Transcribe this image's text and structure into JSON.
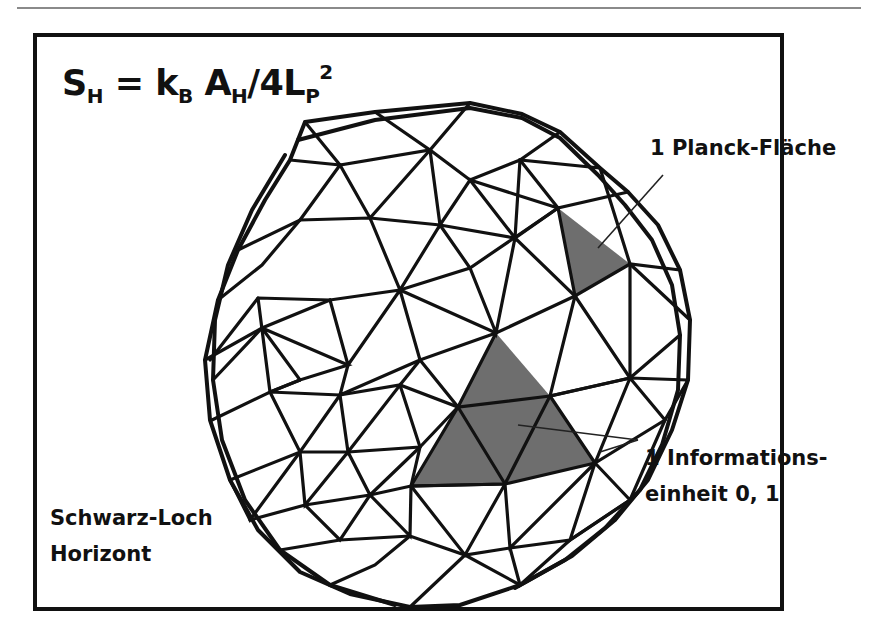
{
  "formula": {
    "S": "S",
    "S_sub": "H",
    "eq": " = ",
    "k": "k",
    "k_sub": "B",
    "A": " A",
    "A_sub": "H",
    "rest": "/4L",
    "L_sub": "P",
    "L_sup": "2"
  },
  "labels": {
    "planck_area": "1 Planck-Fläche",
    "info_line1": "1 Informations-",
    "info_line2": "einheit 0, 1",
    "horizon_line1": "Schwarz-Loch",
    "horizon_line2": "Horizont"
  },
  "colors": {
    "line": "#111111",
    "highlight": "#6e6e6e",
    "frame": "#111111"
  }
}
